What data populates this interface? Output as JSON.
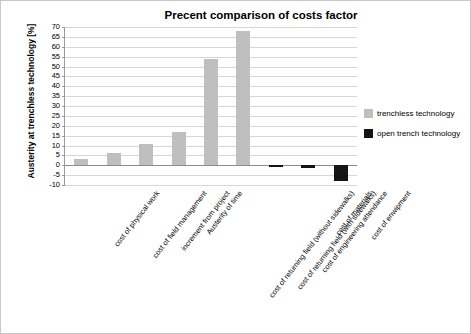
{
  "chart_data": {
    "type": "bar",
    "title": "Precent comparison of costs factor",
    "xlabel": "",
    "ylabel": "Austerity at trenchless technology [%]",
    "ylim": [
      -10,
      70
    ],
    "ytick_step": 5,
    "yticks": [
      "70",
      "65",
      "60",
      "55",
      "50",
      "45",
      "40",
      "35",
      "30",
      "25",
      "20",
      "15",
      "10",
      "5",
      "0",
      "-5",
      "-10"
    ],
    "grid": true,
    "legend_position": "right",
    "categories": [
      "cost of physical work",
      "cost of field management",
      "increment from project",
      "Austerity of time",
      "cost of returning field (without sidewalks)",
      "cost of returning field (with sidewalks)",
      "cost of engineering attendance",
      "cost of materials",
      "cost of enwipment"
    ],
    "series": [
      {
        "name": "trenchless technology",
        "color": "#bfbfbf",
        "values": [
          3,
          6,
          11,
          17,
          54,
          68,
          -1,
          -1.5,
          0
        ]
      },
      {
        "name": "open trench technology",
        "color": "#151515",
        "values": [
          0,
          0,
          0,
          0,
          0,
          0,
          0,
          0,
          -8
        ]
      }
    ],
    "bars": [
      {
        "category": "cost of physical work",
        "value": 3,
        "color": "#bfbfbf"
      },
      {
        "category": "cost of field management",
        "value": 6,
        "color": "#bfbfbf"
      },
      {
        "category": "increment from project",
        "value": 11,
        "color": "#bfbfbf"
      },
      {
        "category": "Austerity of time",
        "value": 17,
        "color": "#bfbfbf"
      },
      {
        "category": "cost of returning field (without sidewalks)",
        "value": 54,
        "color": "#bfbfbf"
      },
      {
        "category": "cost of returning field (with sidewalks)",
        "value": 68,
        "color": "#bfbfbf"
      },
      {
        "category": "cost of engineering attendance",
        "value": -1,
        "color": "#151515"
      },
      {
        "category": "cost of materials",
        "value": -1.5,
        "color": "#151515"
      },
      {
        "category": "cost of enwipment",
        "value": -8,
        "color": "#151515"
      }
    ]
  },
  "legend": {
    "items": [
      {
        "label": "trenchless technology",
        "color": "#bfbfbf"
      },
      {
        "label": "open trench technology",
        "color": "#151515"
      }
    ]
  }
}
